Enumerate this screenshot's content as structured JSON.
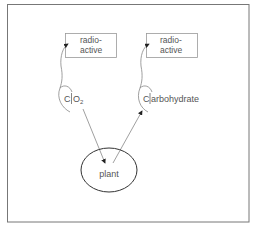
{
  "diagram": {
    "frame": {
      "stroke": "#666666"
    },
    "left_box": {
      "line1": "radio-",
      "line2": "active"
    },
    "right_box": {
      "line1": "radio-",
      "line2": "active"
    },
    "co2_label": {
      "c": "C",
      "rest": "O",
      "sub": "2"
    },
    "carbohydrate_label": {
      "c": "C",
      "rest": "arbohydrate"
    },
    "plant_label": "plant",
    "colors": {
      "line": "#888888",
      "text": "#555555",
      "ellipse": "#333333"
    }
  }
}
